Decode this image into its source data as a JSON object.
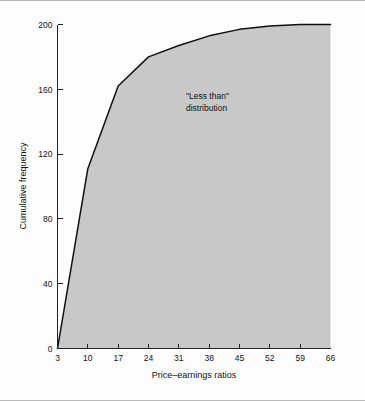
{
  "figure": {
    "background_color": "#fdfdfd",
    "border_color": "#b9b9b9",
    "fill_color": "#c8c8c8",
    "line_color": "#101010"
  },
  "annotation": {
    "line1": "\"Less than\"",
    "line2": "distribution"
  },
  "chart_data": {
    "type": "area",
    "title": "",
    "subtitle": "",
    "xlabel": "Price–earnings ratios",
    "ylabel": "Cumulative frequency",
    "xlim": [
      3,
      66
    ],
    "ylim": [
      0,
      200
    ],
    "grid": false,
    "legend": "none",
    "x_ticks": [
      3,
      10,
      17,
      24,
      31,
      38,
      45,
      52,
      59,
      66
    ],
    "x_tick_labels": [
      "3",
      "10",
      "17",
      "24",
      "31",
      "38",
      "45",
      "52",
      "59",
      "66"
    ],
    "y_ticks": [
      0,
      40,
      80,
      120,
      160,
      200
    ],
    "y_tick_labels": [
      "0",
      "40",
      "80",
      "120",
      "160",
      "200"
    ],
    "series": [
      {
        "name": "\"Less than\" cumulative frequency",
        "x": [
          3,
          10,
          17,
          24,
          31,
          38,
          45,
          52,
          59,
          66
        ],
        "values": [
          0,
          111,
          162,
          180,
          187,
          193,
          197,
          199,
          200,
          200
        ]
      }
    ],
    "annotations": [
      {
        "text": "\"Less than\" distribution",
        "x": 34,
        "y": 155
      }
    ]
  }
}
